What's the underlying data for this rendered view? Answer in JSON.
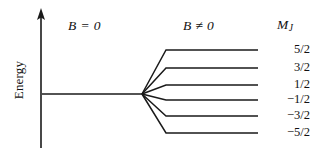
{
  "figure": {
    "background_color": "#ffffff",
    "line_color": "#1a1a1a",
    "text_color": "#111111",
    "axis": {
      "y_label": "Energy",
      "arrow": "up-arrow"
    },
    "headings": {
      "left": "B = 0",
      "right": "B ≠ 0",
      "quantum_number_symbol": "M",
      "quantum_number_subscript": "J"
    }
  },
  "chart_data": {
    "type": "line",
    "xlabel": "",
    "ylabel": "Energy",
    "grid": false,
    "legend": "none",
    "annotations": [
      "B = 0",
      "B ≠ 0",
      "M_J"
    ],
    "unsplit_level": {
      "label": "B = 0",
      "energy": 0,
      "x_start": 42,
      "x_end": 142
    },
    "split_point": {
      "x": 142,
      "y": 94
    },
    "levels": [
      {
        "label": "5/2",
        "mj": 2.5,
        "energy": 2.5,
        "y": 50,
        "x_fan_end": 166,
        "x_end": 258
      },
      {
        "label": "3/2",
        "mj": 1.5,
        "energy": 1.5,
        "y": 68,
        "x_fan_end": 166,
        "x_end": 258
      },
      {
        "label": "1/2",
        "mj": 0.5,
        "energy": 0.5,
        "y": 85,
        "x_fan_end": 166,
        "x_end": 258
      },
      {
        "label": "−1/2",
        "mj": -0.5,
        "energy": -0.5,
        "y": 100,
        "x_fan_end": 166,
        "x_end": 258
      },
      {
        "label": "−3/2",
        "mj": -1.5,
        "energy": -1.5,
        "y": 116,
        "x_fan_end": 166,
        "x_end": 258
      },
      {
        "label": "−5/2",
        "mj": -2.5,
        "energy": -2.5,
        "y": 133,
        "x_fan_end": 166,
        "x_end": 258
      }
    ]
  }
}
